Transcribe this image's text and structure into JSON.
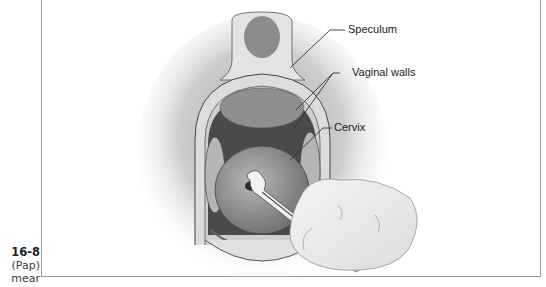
{
  "figure": {
    "number": "16-8",
    "caption_lines": [
      "(Pap)",
      "mear"
    ],
    "labels": {
      "speculum": "Speculum",
      "vaginal_walls": "Vaginal walls",
      "cervix": "Cervix"
    },
    "colors": {
      "frame_border": "#9a9a9a",
      "speculum": "#d8d8d8",
      "cervix": "#9c9c9c",
      "cavity": "#4a4a4a",
      "leader_line": "#333333"
    }
  }
}
